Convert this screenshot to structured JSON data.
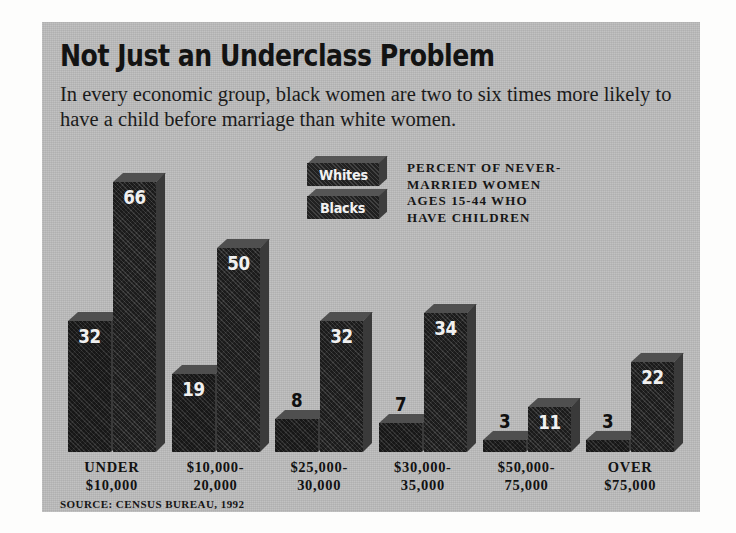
{
  "chart_data": {
    "type": "bar",
    "title": "Not Just an Underclass Problem",
    "subtitle": "In every economic group, black women are two to six times more likely to have a child before marriage than white women.",
    "caption": "PERCENT OF NEVER-\nMARRIED WOMEN\nAGES 15-44 WHO\nHAVE CHILDREN",
    "source": "SOURCE: CENSUS BUREAU, 1992",
    "xlabel": "",
    "ylabel": "Percent",
    "ylim": [
      0,
      70
    ],
    "grid": false,
    "legend_position": "top-center",
    "categories": [
      "UNDER\n$10,000",
      "$10,000-\n20,000",
      "$25,000-\n30,000",
      "$30,000-\n35,000",
      "$50,000-\n75,000",
      "OVER\n$75,000"
    ],
    "series": [
      {
        "name": "Whites",
        "values": [
          32,
          19,
          8,
          7,
          3,
          3
        ]
      },
      {
        "name": "Blacks",
        "values": [
          66,
          50,
          32,
          34,
          11,
          22
        ]
      }
    ]
  },
  "colors": {
    "panel_background": "#bcbcbc",
    "bar_face": "#2a2a2a",
    "bar_top": "#4f4f4f",
    "bar_side": "#3a3a3a",
    "value_label": "#f0f0f0",
    "value_label_outside": "#101010",
    "text": "#131313",
    "rule": "#131313"
  }
}
